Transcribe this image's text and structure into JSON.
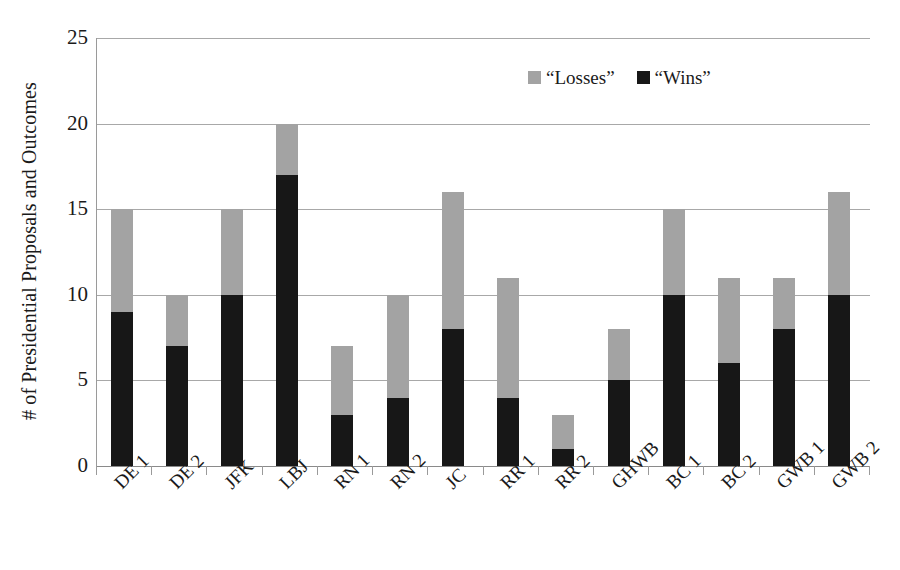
{
  "chart_data": {
    "type": "bar",
    "subtype": "stacked-vertical",
    "title": "",
    "subtitle": "",
    "xlabel": "",
    "ylabel": "# of Presidential Proposals and Outcomes",
    "ylim": [
      0,
      25
    ],
    "ytick_step": 5,
    "yticks": [
      0,
      5,
      10,
      15,
      20,
      25
    ],
    "ytick_labels": [
      "0",
      "5",
      "10",
      "15",
      "20",
      "25"
    ],
    "grid": true,
    "grid_axis": "y",
    "legend_position": "top-center-right",
    "categories": [
      "DE 1",
      "DE 2",
      "JFK",
      "LBJ",
      "RN 1",
      "RN 2",
      "JC",
      "RR 1",
      "RR 2",
      "GHWB",
      "BC 1",
      "BC 2",
      "GWB 1",
      "GWB 2"
    ],
    "series": [
      {
        "name": "“Wins”",
        "color": "#171717",
        "values": [
          9,
          7,
          10,
          17,
          3,
          4,
          8,
          4,
          1,
          5,
          10,
          6,
          8,
          10
        ]
      },
      {
        "name": "“Losses”",
        "color": "#a3a3a3",
        "values": [
          6,
          3,
          5,
          3,
          4,
          6,
          8,
          7,
          2,
          3,
          5,
          5,
          3,
          6
        ]
      }
    ],
    "totals": [
      15,
      10,
      15,
      20,
      7,
      10,
      16,
      11,
      3,
      8,
      15,
      11,
      11,
      16
    ]
  },
  "legend": {
    "items": [
      {
        "label": "“Losses”",
        "color": "#a3a3a3",
        "swatch_name": "losses-swatch"
      },
      {
        "label": "“Wins”",
        "color": "#171717",
        "swatch_name": "wins-swatch"
      }
    ]
  },
  "axes": {
    "y_title": "# of Presidential Proposals and Outcomes"
  }
}
